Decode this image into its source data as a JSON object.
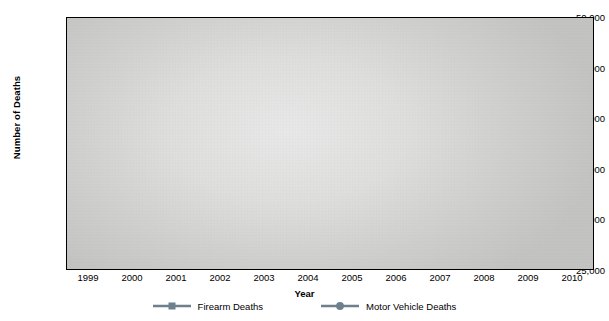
{
  "chart_data": {
    "type": "line",
    "title": "",
    "xlabel": "Year",
    "ylabel": "Number of Deaths",
    "categories": [
      "1999",
      "2000",
      "2001",
      "2002",
      "2003",
      "2004",
      "2005",
      "2006",
      "2007",
      "2008",
      "2009",
      "2010"
    ],
    "x": [
      1999,
      2000,
      2001,
      2002,
      2003,
      2004,
      2005,
      2006,
      2007,
      2008,
      2009,
      2010
    ],
    "ylim": [
      25000,
      50000
    ],
    "ytick_labels": [
      "25,000",
      "30,000",
      "35,000",
      "40,000",
      "45,000",
      "50,000"
    ],
    "ytick_values": [
      25000,
      30000,
      35000,
      40000,
      45000,
      50000
    ],
    "grid": "horizontal-dashed",
    "legend_position": "bottom-center",
    "series": [
      {
        "name": "Firearm Deaths",
        "marker": "square",
        "color": "#6e7f8d",
        "values": [
          42500,
          43500,
          44000,
          45500,
          44800,
          45000,
          45600,
          45500,
          44000,
          40000,
          36600,
          35500
        ]
      },
      {
        "name": "Motor Vehicle Deaths",
        "marker": "circle",
        "color": "#6e7f8d",
        "values": [
          29000,
          28500,
          29500,
          30300,
          30200,
          29600,
          30700,
          30900,
          31300,
          31800,
          31300,
          31800
        ]
      }
    ]
  },
  "colors": {
    "series_line": "#6e7f8d",
    "axis": "#000000",
    "gridline": "#1a1a1a",
    "plot_background": "#dededd",
    "page_background": "#ffffff"
  }
}
